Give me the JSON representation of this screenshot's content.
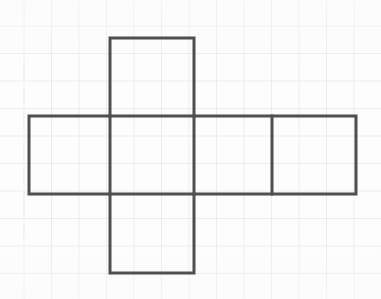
{
  "figure": {
    "title": "Cube net (cross / Latin-cross arrangement of six squares)",
    "shape_name": "cube-net",
    "background_color": "#fdfdfd",
    "grid_color": "#ececed",
    "grid_spacing_px": 27.5,
    "stroke_color": "#4f4f4f",
    "stroke_width_px": 3,
    "canvas": {
      "width": 381,
      "height": 299
    },
    "square_count": 6,
    "squares": [
      {
        "name": "top-square",
        "x": 110,
        "y": 38,
        "w": 84,
        "h": 78
      },
      {
        "name": "left-square",
        "x": 29,
        "y": 116,
        "w": 81,
        "h": 78
      },
      {
        "name": "center-square",
        "x": 110,
        "y": 116,
        "w": 84,
        "h": 78
      },
      {
        "name": "right-inner-square",
        "x": 194,
        "y": 116,
        "w": 78,
        "h": 78
      },
      {
        "name": "right-outer-square",
        "x": 272,
        "y": 116,
        "w": 84,
        "h": 78
      },
      {
        "name": "bottom-square",
        "x": 110,
        "y": 194,
        "w": 84,
        "h": 79
      }
    ],
    "outline_path": "M 110 38 L 194 38 L 194 116 L 356 116 L 356 194 L 194 194 L 194 273 L 110 273 L 110 194 L 29 194 L 29 116 L 110 116 Z",
    "interior_segments": [
      {
        "name": "divider-top-center",
        "x1": 110,
        "y1": 116,
        "x2": 194,
        "y2": 116
      },
      {
        "name": "divider-center-bottom",
        "x1": 110,
        "y1": 194,
        "x2": 194,
        "y2": 194
      },
      {
        "name": "divider-left-center",
        "x1": 110,
        "y1": 116,
        "x2": 110,
        "y2": 194
      },
      {
        "name": "divider-center-right",
        "x1": 194,
        "y1": 116,
        "x2": 194,
        "y2": 194
      },
      {
        "name": "divider-right-pair",
        "x1": 272,
        "y1": 116,
        "x2": 272,
        "y2": 194
      }
    ]
  }
}
